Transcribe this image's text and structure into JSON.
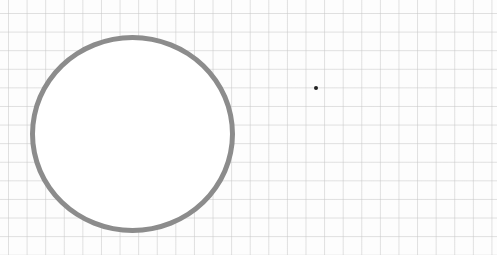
{
  "scene": {
    "description": "Hand-drawn style gray circle on graph paper with a small dot to the right",
    "background": {
      "type": "grid-paper",
      "color": "#fdfdfd",
      "grid_color": "#c8c8c8",
      "grid_spacing_px": 18.6
    },
    "shapes": [
      {
        "type": "circle",
        "stroke_color": "#8c8c8c",
        "fill": "#ffffff",
        "center": [
          132,
          134
        ],
        "radius_approx": 101
      },
      {
        "type": "dot",
        "color": "#222222",
        "center": [
          316,
          88
        ]
      }
    ]
  }
}
